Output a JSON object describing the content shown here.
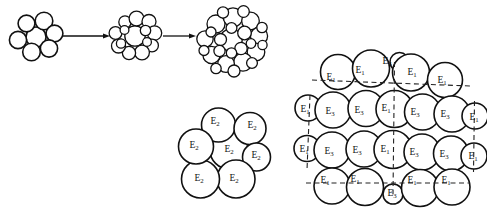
{
  "figure": {
    "background_color": "#ffffff",
    "stroke_color": "#111111",
    "dash_color": "#222222",
    "width": 487,
    "height": 218
  },
  "stages": {
    "description": "Three successive aggregate clusters joined by rightward arrows",
    "arrow_symbol": "→",
    "items": [
      {
        "name": "stage-1-cluster",
        "circle_count": 7,
        "cx": 36,
        "cy": 37,
        "circles": [
          {
            "cx": 36.0,
            "cy": 37.0,
            "r": 10.0
          },
          {
            "cx": 26.5,
            "cy": 23.5,
            "r": 8.4
          },
          {
            "cx": 44.0,
            "cy": 21.0,
            "r": 8.8
          },
          {
            "cx": 54.5,
            "cy": 33.5,
            "r": 8.4
          },
          {
            "cx": 49.0,
            "cy": 48.5,
            "r": 8.6
          },
          {
            "cx": 31.5,
            "cy": 52.0,
            "r": 8.8
          },
          {
            "cx": 18.0,
            "cy": 40.0,
            "r": 8.6
          }
        ]
      },
      {
        "name": "stage-2-cluster",
        "circle_count": 14,
        "cx": 135,
        "cy": 37,
        "circles": [
          {
            "cx": 135.0,
            "cy": 36.0,
            "r": 10.2
          },
          {
            "cx": 125.0,
            "cy": 22.0,
            "r": 6.2
          },
          {
            "cx": 136.5,
            "cy": 18.5,
            "r": 7.4
          },
          {
            "cx": 149.0,
            "cy": 21.5,
            "r": 7.0
          },
          {
            "cx": 154.5,
            "cy": 33.0,
            "r": 7.2
          },
          {
            "cx": 152.0,
            "cy": 45.5,
            "r": 6.4
          },
          {
            "cx": 142.0,
            "cy": 52.5,
            "r": 7.4
          },
          {
            "cx": 129.0,
            "cy": 53.0,
            "r": 6.6
          },
          {
            "cx": 118.5,
            "cy": 46.0,
            "r": 7.0
          },
          {
            "cx": 115.5,
            "cy": 33.0,
            "r": 6.4
          },
          {
            "cx": 121.0,
            "cy": 43.5,
            "r": 4.6
          },
          {
            "cx": 145.5,
            "cy": 30.5,
            "r": 5.2
          },
          {
            "cx": 124.5,
            "cy": 30.0,
            "r": 4.4
          },
          {
            "cx": 147.0,
            "cy": 42.0,
            "r": 4.4
          }
        ]
      },
      {
        "name": "stage-3-cluster",
        "circle_count": 26,
        "cx": 231,
        "cy": 41,
        "circles": [
          {
            "cx": 231.0,
            "cy": 40.0,
            "r": 11.2
          },
          {
            "cx": 216.0,
            "cy": 24.0,
            "r": 9.0
          },
          {
            "cx": 233.0,
            "cy": 17.5,
            "r": 9.6
          },
          {
            "cx": 250.5,
            "cy": 21.0,
            "r": 8.8
          },
          {
            "cx": 259.0,
            "cy": 36.0,
            "r": 8.6
          },
          {
            "cx": 256.0,
            "cy": 52.0,
            "r": 8.8
          },
          {
            "cx": 243.0,
            "cy": 62.0,
            "r": 9.2
          },
          {
            "cx": 226.0,
            "cy": 64.0,
            "r": 8.4
          },
          {
            "cx": 211.5,
            "cy": 55.0,
            "r": 8.6
          },
          {
            "cx": 205.0,
            "cy": 39.0,
            "r": 8.2
          },
          {
            "cx": 220.5,
            "cy": 39.5,
            "r": 6.0
          },
          {
            "cx": 244.5,
            "cy": 33.0,
            "r": 6.8
          },
          {
            "cx": 241.0,
            "cy": 48.5,
            "r": 6.2
          },
          {
            "cx": 219.5,
            "cy": 51.0,
            "r": 5.6
          },
          {
            "cx": 231.5,
            "cy": 28.0,
            "r": 5.4
          },
          {
            "cx": 251.0,
            "cy": 43.5,
            "r": 4.8
          },
          {
            "cx": 211.0,
            "cy": 32.0,
            "r": 5.0
          },
          {
            "cx": 223.0,
            "cy": 12.5,
            "r": 5.6
          },
          {
            "cx": 243.5,
            "cy": 11.5,
            "r": 5.8
          },
          {
            "cx": 262.0,
            "cy": 27.5,
            "r": 5.2
          },
          {
            "cx": 262.5,
            "cy": 45.0,
            "r": 4.6
          },
          {
            "cx": 234.0,
            "cy": 71.0,
            "r": 6.0
          },
          {
            "cx": 252.0,
            "cy": 63.0,
            "r": 5.4
          },
          {
            "cx": 216.0,
            "cy": 68.5,
            "r": 5.2
          },
          {
            "cx": 204.0,
            "cy": 50.5,
            "r": 5.0
          },
          {
            "cx": 231.5,
            "cy": 53.0,
            "r": 5.2
          }
        ]
      }
    ],
    "arrows": [
      {
        "name": "arrow-stage1-to-stage2",
        "x1": 63,
        "y1": 36,
        "x2": 110,
        "y2": 36
      },
      {
        "name": "arrow-stage2-to-stage3",
        "x1": 163,
        "y1": 36,
        "x2": 196,
        "y2": 36
      }
    ]
  },
  "mid_cluster": {
    "name": "e2-cluster",
    "label_text": "E",
    "label_subscript": "2",
    "circle_count": 7,
    "circles": [
      {
        "id": "e2-center",
        "cx": 229.0,
        "cy": 150.0,
        "r": 19.0,
        "label": "E",
        "sub": "2",
        "lx": 229.0,
        "ly": 150.0
      },
      {
        "id": "e2-top",
        "cx": 218.5,
        "cy": 125.0,
        "r": 17.0,
        "label": "E",
        "sub": "2",
        "lx": 215.0,
        "ly": 122.0
      },
      {
        "id": "e2-top-right",
        "cx": 250.0,
        "cy": 128.5,
        "r": 16.0,
        "label": "E",
        "sub": "2",
        "lx": 252.0,
        "ly": 126.0
      },
      {
        "id": "e2-right",
        "cx": 256.5,
        "cy": 157.0,
        "r": 14.0,
        "label": "E",
        "sub": "2",
        "lx": 256.0,
        "ly": 156.0
      },
      {
        "id": "e2-bottom-right",
        "cx": 236.0,
        "cy": 179.0,
        "r": 19.0,
        "label": "E",
        "sub": "2",
        "lx": 234.0,
        "ly": 179.0
      },
      {
        "id": "e2-bottom-left",
        "cx": 200.5,
        "cy": 179.0,
        "r": 19.0,
        "label": "E",
        "sub": "2",
        "lx": 199.0,
        "ly": 179.0
      },
      {
        "id": "e2-left",
        "cx": 196.0,
        "cy": 146.5,
        "r": 17.5,
        "label": "E",
        "sub": "2",
        "lx": 194.0,
        "ly": 146.0
      }
    ]
  },
  "right_cluster": {
    "name": "packed-aggregate",
    "description": "Large close-packed aggregate with E1 and E3 labelled spheres and a dashed unit-cell grid",
    "label_rows": [
      {
        "row": 1,
        "labels": [
          "E1",
          "E1",
          "E3",
          "E1",
          "E1"
        ]
      },
      {
        "row": 2,
        "labels": [
          "E1",
          "E3",
          "E3",
          "E1",
          "E3",
          "E3",
          "E1"
        ]
      },
      {
        "row": 3,
        "labels": [
          "E1",
          "E3",
          "E3",
          "E1",
          "E3",
          "E3",
          "E1"
        ]
      },
      {
        "row": 4,
        "labels": [
          "E1",
          "E1",
          "E3",
          "E1",
          "E1"
        ]
      }
    ],
    "circles": [
      {
        "id": "r0c0",
        "cx": 338.0,
        "cy": 72.0,
        "r": 17.5,
        "label": "E",
        "sub": "1",
        "lx": 331.0,
        "ly": 78.0
      },
      {
        "id": "r0c1",
        "cx": 371.0,
        "cy": 68.5,
        "r": 18.5,
        "label": "E",
        "sub": "1",
        "lx": 360.0,
        "ly": 71.0
      },
      {
        "id": "r0c2",
        "cx": 399.5,
        "cy": 62.0,
        "r": 9.5,
        "label": "E",
        "sub": "3",
        "lx": 387.0,
        "ly": 62.0
      },
      {
        "id": "r0c3",
        "cx": 411.0,
        "cy": 72.5,
        "r": 18.5,
        "label": "E",
        "sub": "1",
        "lx": 412.0,
        "ly": 73.0
      },
      {
        "id": "r0c4",
        "cx": 445.0,
        "cy": 80.0,
        "r": 17.5,
        "label": "E",
        "sub": "1",
        "lx": 442.0,
        "ly": 81.0
      },
      {
        "id": "r1c0",
        "cx": 308.0,
        "cy": 108.0,
        "r": 13.0,
        "label": "E",
        "sub": "1",
        "lx": 305.0,
        "ly": 110.0
      },
      {
        "id": "r1c1",
        "cx": 333.0,
        "cy": 110.0,
        "r": 18.0,
        "label": "E",
        "sub": "3",
        "lx": 330.0,
        "ly": 112.0
      },
      {
        "id": "r1c2",
        "cx": 366.0,
        "cy": 108.5,
        "r": 18.0,
        "label": "E",
        "sub": "3",
        "lx": 359.0,
        "ly": 111.0
      },
      {
        "id": "r1c3",
        "cx": 394.5,
        "cy": 109.0,
        "r": 18.5,
        "label": "E",
        "sub": "1",
        "lx": 386.0,
        "ly": 109.0
      },
      {
        "id": "r1c4",
        "cx": 422.5,
        "cy": 112.0,
        "r": 18.0,
        "label": "E",
        "sub": "3",
        "lx": 415.0,
        "ly": 113.0
      },
      {
        "id": "r1c5",
        "cx": 452.0,
        "cy": 114.0,
        "r": 18.0,
        "label": "E",
        "sub": "3",
        "lx": 445.0,
        "ly": 115.0
      },
      {
        "id": "r1c6",
        "cx": 475.0,
        "cy": 116.0,
        "r": 13.0,
        "label": "E",
        "sub": "1",
        "lx": 474.0,
        "ly": 118.0
      },
      {
        "id": "r2c0",
        "cx": 307.0,
        "cy": 148.5,
        "r": 13.0,
        "label": "E",
        "sub": "1",
        "lx": 304.0,
        "ly": 150.0
      },
      {
        "id": "r2c1",
        "cx": 332.0,
        "cy": 150.0,
        "r": 18.0,
        "label": "E",
        "sub": "3",
        "lx": 329.0,
        "ly": 152.0
      },
      {
        "id": "r2c2",
        "cx": 364.0,
        "cy": 149.0,
        "r": 18.0,
        "label": "E",
        "sub": "3",
        "lx": 357.0,
        "ly": 151.0
      },
      {
        "id": "r2c3",
        "cx": 393.0,
        "cy": 149.5,
        "r": 19.0,
        "label": "E",
        "sub": "1",
        "lx": 385.0,
        "ly": 150.0
      },
      {
        "id": "r2c4",
        "cx": 422.0,
        "cy": 152.0,
        "r": 18.0,
        "label": "E",
        "sub": "3",
        "lx": 414.0,
        "ly": 153.0
      },
      {
        "id": "r2c5",
        "cx": 451.0,
        "cy": 153.5,
        "r": 17.5,
        "label": "E",
        "sub": "3",
        "lx": 444.0,
        "ly": 155.0
      },
      {
        "id": "r2c6",
        "cx": 474.0,
        "cy": 156.0,
        "r": 13.0,
        "label": "E",
        "sub": "1",
        "lx": 473.0,
        "ly": 157.0
      },
      {
        "id": "r3c0",
        "cx": 332.0,
        "cy": 186.0,
        "r": 18.0,
        "label": "E",
        "sub": "1",
        "lx": 325.0,
        "ly": 181.0
      },
      {
        "id": "r3c1",
        "cx": 365.0,
        "cy": 187.0,
        "r": 18.5,
        "label": "E",
        "sub": "1",
        "lx": 355.0,
        "ly": 180.0
      },
      {
        "id": "r3c2",
        "cx": 393.0,
        "cy": 194.0,
        "r": 10.0,
        "label": "E",
        "sub": "3",
        "lx": 392.0,
        "ly": 194.0
      },
      {
        "id": "r3c3",
        "cx": 420.0,
        "cy": 188.0,
        "r": 18.5,
        "label": "E",
        "sub": "1",
        "lx": 412.0,
        "ly": 181.0
      },
      {
        "id": "r3c4",
        "cx": 452.0,
        "cy": 187.0,
        "r": 18.0,
        "label": "E",
        "sub": "1",
        "lx": 446.0,
        "ly": 181.0
      }
    ],
    "grid": {
      "description": "dashed unit-cell lines: two horizontal, three vertical",
      "horizontal": [
        {
          "name": "grid-h-top",
          "x1": 312.0,
          "y1": 80.0,
          "x2": 470.0,
          "y2": 86.0
        },
        {
          "name": "grid-h-bottom",
          "x1": 306.0,
          "y1": 183.0,
          "x2": 470.0,
          "y2": 183.0
        }
      ],
      "vertical": [
        {
          "name": "grid-v-left",
          "x1": 310.0,
          "y1": 95.0,
          "x2": 307.0,
          "y2": 170.0
        },
        {
          "name": "grid-v-center",
          "x1": 394.5,
          "y1": 62.0,
          "x2": 393.0,
          "y2": 194.0
        },
        {
          "name": "grid-v-right",
          "x1": 474.5,
          "y1": 101.0,
          "x2": 473.5,
          "y2": 172.0
        }
      ]
    }
  }
}
